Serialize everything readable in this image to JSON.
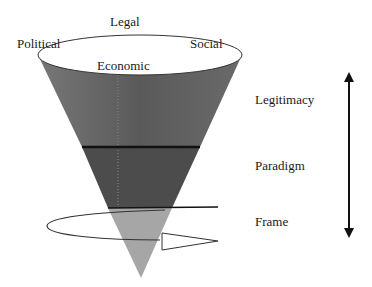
{
  "diagram": {
    "rim_labels": {
      "top": "Legal",
      "left": "Political",
      "right": "Social",
      "front": "Economic"
    },
    "layers": [
      {
        "name": "Legitimacy",
        "color": "#5e5e5e"
      },
      {
        "name": "Paradigm",
        "color": "#4a4a4a"
      },
      {
        "name": "Frame",
        "color": "#a4a4a4"
      }
    ],
    "scale_arrow": "double-headed vertical arrow"
  }
}
